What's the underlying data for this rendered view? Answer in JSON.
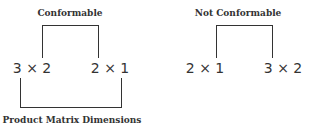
{
  "diagram": {
    "left": {
      "label": "Conformable",
      "first_dim": "3 × 2",
      "second_dim": "2 × 1",
      "bottom_label": "Product Matrix Dimensions"
    },
    "right": {
      "label": "Not Conformable",
      "first_dim": "2 × 1",
      "second_dim": "3 × 2"
    },
    "colors": {
      "line": "#333333",
      "text": "#333333",
      "background": "#ffffff"
    }
  }
}
